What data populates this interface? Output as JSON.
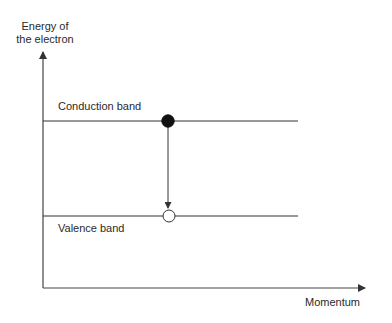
{
  "diagram": {
    "y_axis": {
      "label_line1": "Energy of",
      "label_line2": "the electron"
    },
    "x_axis": {
      "label": "Momentum"
    },
    "bands": [
      {
        "name": "Conduction band",
        "label": "Conduction band"
      },
      {
        "name": "Valence band",
        "label": "Valence band"
      }
    ],
    "electron": {
      "state": "filled",
      "band": "Conduction band"
    },
    "hole": {
      "state": "empty",
      "band": "Valence band"
    },
    "transition": {
      "direction": "down",
      "from": "Conduction band",
      "to": "Valence band"
    },
    "colors": {
      "axis": "#333333",
      "band_line": "#333333",
      "electron_fill": "#111111",
      "hole_fill": "#ffffff",
      "text": "#2a2a2a"
    }
  }
}
